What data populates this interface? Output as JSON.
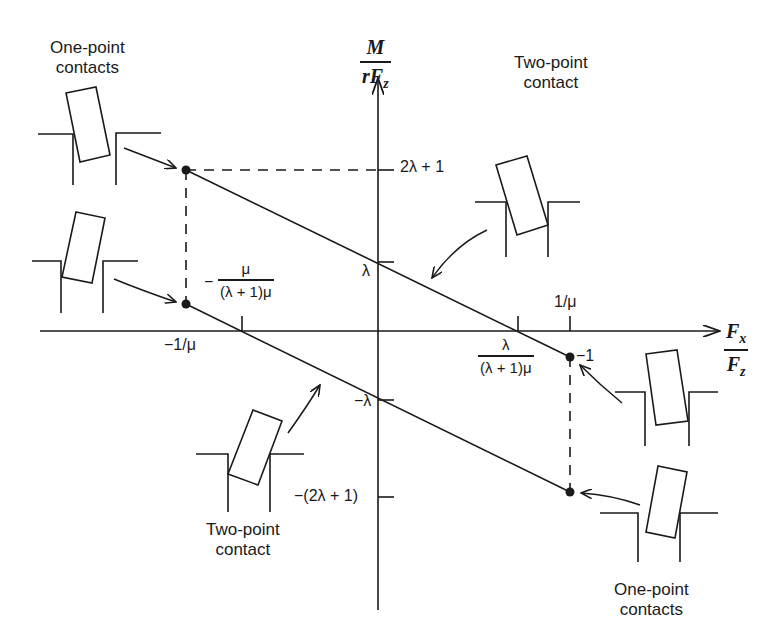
{
  "diagram": {
    "type": "friction-moment line diagram (peg-in-hole contact states)",
    "axes": {
      "y_label": {
        "numerator": "M",
        "denominator": "rF_z"
      },
      "x_label": {
        "numerator": "F_x",
        "denominator": "F_z"
      }
    },
    "y_ticks": {
      "top": "2λ + 1",
      "lambda": "λ",
      "neg_lambda": "−λ",
      "bottom": "−(2λ + 1)"
    },
    "x_ticks": {
      "neg_inv_mu": "−1/μ",
      "inv_mu": "1/μ",
      "neg_frac_num": "μ",
      "neg_frac_den": "(λ + 1)μ",
      "neg_frac_sign": "−",
      "pos_frac_num": "λ",
      "pos_frac_den": "(λ + 1)μ",
      "minus_one": "−1"
    },
    "captions": {
      "top_left": [
        "One-point",
        "contacts"
      ],
      "top_right": [
        "Two-point",
        "contact"
      ],
      "bottom_left": [
        "Two-point",
        "contact"
      ],
      "bottom_right": [
        "One-point",
        "contacts"
      ]
    },
    "icons": [
      "peg-tilted-one-point-upper-left",
      "peg-tilted-one-point-mid-left",
      "peg-tilted-two-point-upper-right",
      "peg-tilted-two-point-lower-left",
      "peg-tilted-one-point-mid-right",
      "peg-tilted-one-point-lower-right"
    ],
    "colors": {
      "ink": "#1a1a1a",
      "background": "#ffffff"
    }
  }
}
